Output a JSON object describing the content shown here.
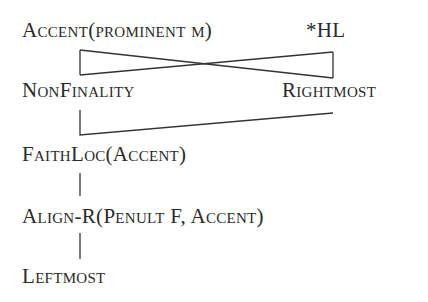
{
  "diagram": {
    "type": "constraint-ranking-hasse",
    "nodes": [
      {
        "id": "accent",
        "label": "Accent(prominent μ)"
      },
      {
        "id": "hl",
        "label": "*HL"
      },
      {
        "id": "nonfinality",
        "label": "NonFinality"
      },
      {
        "id": "rightmost",
        "label": "Rightmost"
      },
      {
        "id": "faithloc",
        "label": "FaithLoc(Accent)"
      },
      {
        "id": "align",
        "label": "Align-R(Penult F, Accent)"
      },
      {
        "id": "leftmost",
        "label": "Leftmost"
      }
    ],
    "edges": [
      {
        "from": "accent",
        "to": "nonfinality"
      },
      {
        "from": "accent",
        "to": "rightmost"
      },
      {
        "from": "hl",
        "to": "nonfinality"
      },
      {
        "from": "hl",
        "to": "rightmost"
      },
      {
        "from": "nonfinality",
        "to": "faithloc"
      },
      {
        "from": "rightmost",
        "to": "faithloc"
      },
      {
        "from": "faithloc",
        "to": "align"
      },
      {
        "from": "align",
        "to": "leftmost"
      }
    ]
  }
}
